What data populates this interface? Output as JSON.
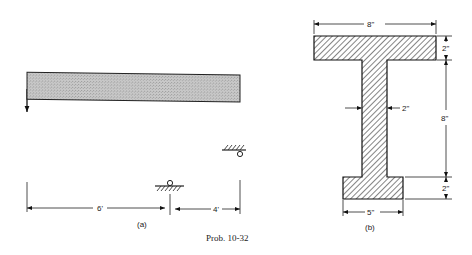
{
  "figure": {
    "caption": "Prob. 10-32",
    "panels": [
      {
        "id": "a",
        "label": "(a)",
        "description": "Beam with point load P at left end, roller support at 6 ft, pinned to ceiling at right end",
        "load_label": "P",
        "dimensions": [
          "6'",
          "4'"
        ]
      },
      {
        "id": "b",
        "label": "(b)",
        "description": "I-shaped cross section",
        "dimensions": {
          "top_flange_width": "8\"",
          "top_flange_thickness": "2\"",
          "web_thickness": "2\"",
          "web_height": "8\"",
          "bottom_flange_thickness": "2\"",
          "bottom_flange_width": "5\""
        }
      }
    ]
  }
}
